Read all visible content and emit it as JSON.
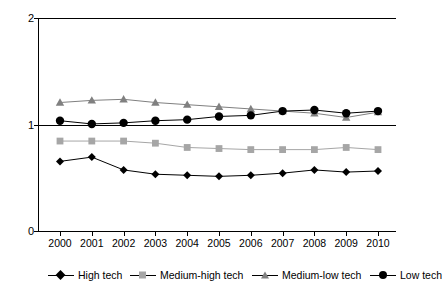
{
  "chart_data": {
    "type": "line",
    "title": "",
    "xlabel": "",
    "ylabel": "",
    "x": [
      "2000",
      "2001",
      "2002",
      "2003",
      "2004",
      "2005",
      "2006",
      "2007",
      "2008",
      "2009",
      "2010"
    ],
    "ylim": [
      0,
      2
    ],
    "yticks": [
      "0",
      "1",
      "2"
    ],
    "grid": false,
    "legend_position": "bottom",
    "series": [
      {
        "name": "High tech",
        "color": "#000000",
        "marker": "diamond",
        "values": [
          0.66,
          0.7,
          0.58,
          0.54,
          0.53,
          0.52,
          0.53,
          0.55,
          0.58,
          0.56,
          0.57
        ]
      },
      {
        "name": "Medium-high tech",
        "color": "#a6a6a6",
        "marker": "square",
        "values": [
          0.85,
          0.85,
          0.85,
          0.83,
          0.79,
          0.78,
          0.77,
          0.77,
          0.77,
          0.79,
          0.77
        ]
      },
      {
        "name": "Medium-low tech",
        "color": "#808080",
        "marker": "triangle",
        "values": [
          1.21,
          1.23,
          1.24,
          1.21,
          1.19,
          1.17,
          1.15,
          1.13,
          1.11,
          1.07,
          1.12
        ]
      },
      {
        "name": "Low tech",
        "color": "#000000",
        "marker": "circle",
        "values": [
          1.04,
          1.01,
          1.02,
          1.04,
          1.05,
          1.08,
          1.09,
          1.13,
          1.14,
          1.11,
          1.13
        ]
      }
    ]
  },
  "axis": {
    "y_top": "2",
    "y_mid": "1",
    "y_bottom": "0"
  },
  "legend": {
    "items": [
      {
        "label": "High tech",
        "marker": "diamond-marker"
      },
      {
        "label": "Medium-high tech",
        "marker": "square-marker"
      },
      {
        "label": "Medium-low tech",
        "marker": "triangle-marker"
      },
      {
        "label": "Low tech",
        "marker": "circle-marker"
      }
    ]
  }
}
